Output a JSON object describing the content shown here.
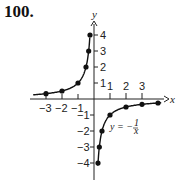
{
  "problem_number": "100.",
  "chart_data": {
    "type": "line",
    "title": "",
    "equation_label": "y = -1/x",
    "xlabel": "x",
    "ylabel": "y",
    "xlim": [
      -4,
      4
    ],
    "ylim": [
      -4.5,
      4.5
    ],
    "x_tick_labels": [
      "-3",
      "-2",
      "-1",
      "1",
      "2",
      "3"
    ],
    "y_tick_labels": [
      "1",
      "2",
      "3",
      "4",
      "-1",
      "-2",
      "-3",
      "-4"
    ],
    "grid": false,
    "legend": "none",
    "series": [
      {
        "name": "y = -1/x (x < 0)",
        "points": [
          [
            -3,
            0.333
          ],
          [
            -2,
            0.5
          ],
          [
            -1,
            1
          ],
          [
            -0.5,
            2
          ],
          [
            -0.333,
            3
          ],
          [
            -0.25,
            4
          ]
        ]
      },
      {
        "name": "y = -1/x (x > 0)",
        "points": [
          [
            0.25,
            -4
          ],
          [
            0.333,
            -3
          ],
          [
            0.5,
            -2
          ],
          [
            1,
            -1
          ],
          [
            2,
            -0.5
          ],
          [
            3,
            -0.333
          ],
          [
            4,
            -0.25
          ]
        ]
      }
    ]
  }
}
